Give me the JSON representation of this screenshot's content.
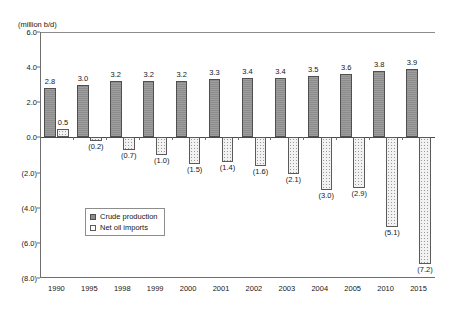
{
  "chart_data": {
    "type": "bar",
    "title": "",
    "subtitle": "",
    "ylabel": "(million b/d)",
    "xlabel": "",
    "ylim": [
      -8.0,
      6.0
    ],
    "yticks": [
      "6.0",
      "4.0",
      "2.0",
      "0.0",
      "(2.0)",
      "(4.0)",
      "(6.0)",
      "(8.0)"
    ],
    "ytick_values": [
      6.0,
      4.0,
      2.0,
      0.0,
      -2.0,
      -4.0,
      -6.0,
      -8.0
    ],
    "grid": false,
    "legend_position": "inside-lower-left",
    "categories": [
      "1990",
      "1995",
      "1998",
      "1999",
      "2000",
      "2001",
      "2002",
      "2003",
      "2004",
      "2005",
      "2010",
      "2015"
    ],
    "series": [
      {
        "name": "Crude production",
        "values": [
          2.8,
          3.0,
          3.2,
          3.2,
          3.2,
          3.3,
          3.4,
          3.4,
          3.5,
          3.6,
          3.8,
          3.9
        ],
        "labels": [
          "2.8",
          "3.0",
          "3.2",
          "3.2",
          "3.2",
          "3.3",
          "3.4",
          "3.4",
          "3.5",
          "3.6",
          "3.8",
          "3.9"
        ]
      },
      {
        "name": "Net oil imports",
        "values": [
          0.5,
          -0.2,
          -0.7,
          -1.0,
          -1.5,
          -1.4,
          -1.6,
          -2.1,
          -3.0,
          -2.9,
          -5.1,
          -7.2
        ],
        "labels": [
          "0.5",
          "(0.2)",
          "(0.7)",
          "(1.0)",
          "(1.5)",
          "(1.4)",
          "(1.6)",
          "(2.1)",
          "(3.0)",
          "(2.9)",
          "(5.1)",
          "(7.2)"
        ]
      }
    ]
  },
  "legend": {
    "items": [
      {
        "label": "Crude production"
      },
      {
        "label": "Net oil imports"
      }
    ]
  }
}
